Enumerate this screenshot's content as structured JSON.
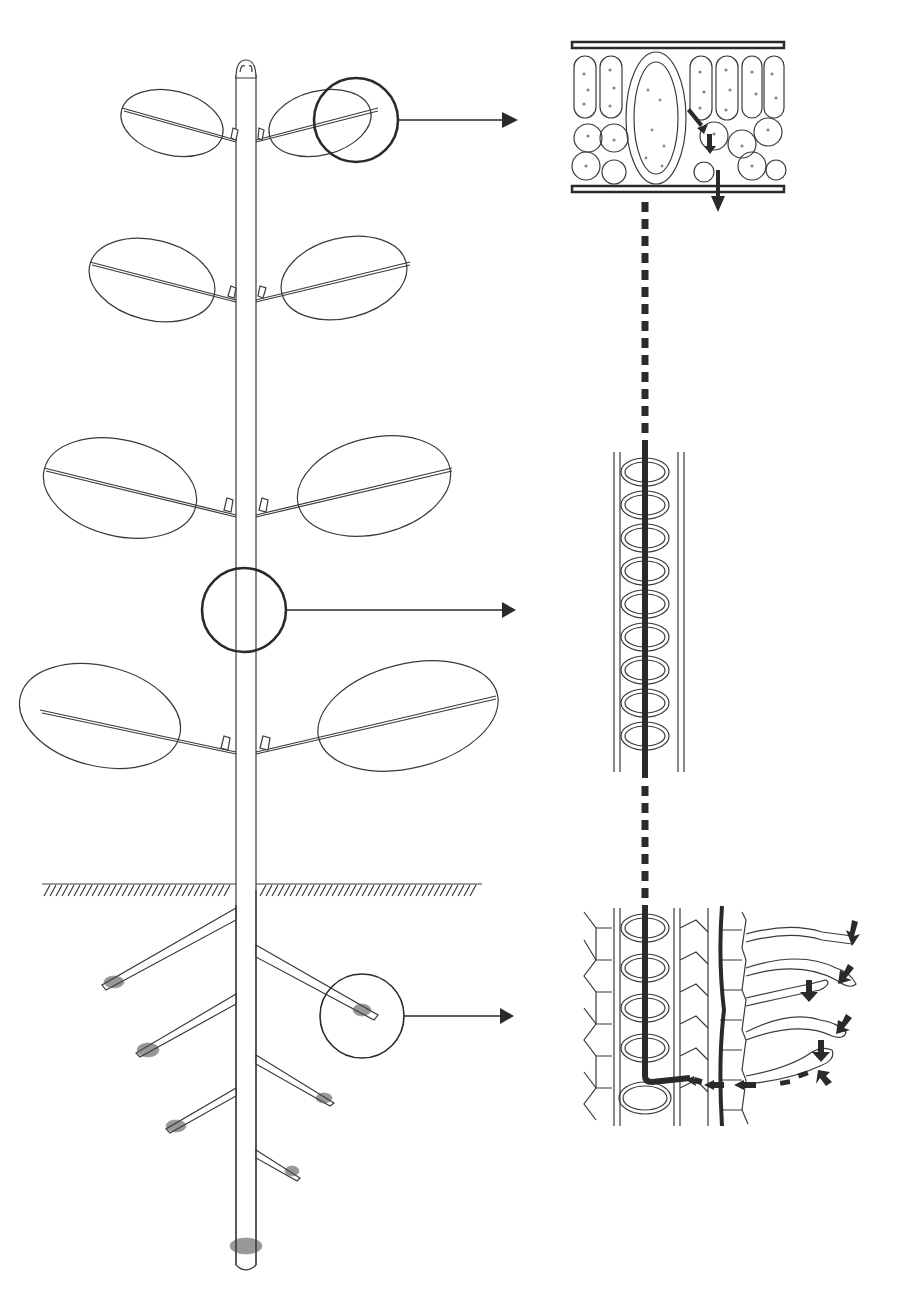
{
  "diagram": {
    "title": "",
    "colors": {
      "ink": "#2b2b2b",
      "background": "#ffffff"
    },
    "plant": {
      "leaf_pairs": 4,
      "root_branches": 6,
      "soil_line": "hatched ground surface"
    },
    "callouts": [
      {
        "id": "leaf",
        "target": "leaf cross-section with vein, palisade and spongy mesophyll, stomatal exit arrows"
      },
      {
        "id": "stem",
        "target": "xylem vessel elements with continuous water column"
      },
      {
        "id": "root",
        "target": "root tissue with root hairs, cortex cells and xylem; inward water arrows"
      }
    ],
    "labels": []
  }
}
